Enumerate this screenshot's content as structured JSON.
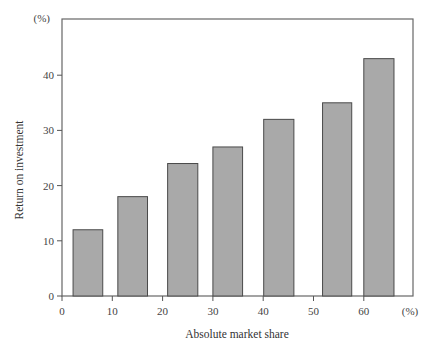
{
  "chart_data": {
    "type": "bar",
    "title": "",
    "xlabel": "Absolute market share",
    "ylabel": "Return on investment",
    "x_unit": "(%)",
    "y_unit": "(%)",
    "categories": [
      "0-10",
      "10-20",
      "20-30",
      "30-40",
      "40-50",
      "50-60",
      "60+"
    ],
    "bars": [
      {
        "x_start": 2.2,
        "x_end": 8.1,
        "value": 12
      },
      {
        "x_start": 11.1,
        "x_end": 17.0,
        "value": 18
      },
      {
        "x_start": 21.0,
        "x_end": 27.0,
        "value": 24
      },
      {
        "x_start": 30.0,
        "x_end": 35.9,
        "value": 27
      },
      {
        "x_start": 40.1,
        "x_end": 46.1,
        "value": 32
      },
      {
        "x_start": 51.8,
        "x_end": 57.6,
        "value": 35
      },
      {
        "x_start": 60.0,
        "x_end": 66.0,
        "value": 43
      }
    ],
    "values": [
      12,
      18,
      24,
      27,
      32,
      35,
      43
    ],
    "xlim": [
      0,
      70
    ],
    "ylim": [
      0,
      50
    ],
    "xticks": [
      0,
      10,
      20,
      30,
      40,
      50,
      60
    ],
    "yticks": [
      0,
      10,
      20,
      30,
      40
    ],
    "grid": false,
    "legend": null,
    "colors": {
      "bar_fill": "#a9a9a9",
      "bar_edge": "#4a4a4a",
      "frame": "#666666"
    }
  }
}
